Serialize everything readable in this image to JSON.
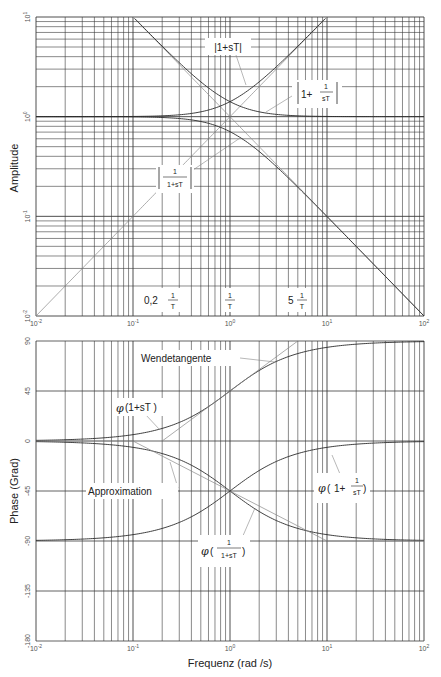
{
  "chart_data": [
    {
      "type": "line",
      "title": "",
      "xscale": "log",
      "yscale": "log",
      "xlabel": "",
      "ylabel": "Amplitude",
      "xlim": [
        0.01,
        100
      ],
      "ylim": [
        0.01,
        10
      ],
      "grid": true,
      "x_tick_labels": [
        "10^-2",
        "10^-1",
        "10^0",
        "10^1",
        "10^2"
      ],
      "y_tick_labels": [
        "10^-2",
        "10^-1",
        "10^0",
        "10^1"
      ],
      "x": [
        0.01,
        0.1,
        0.2,
        0.5,
        1,
        2,
        5,
        10,
        100
      ],
      "series": [
        {
          "name": "|1+sT|",
          "values": [
            1.0,
            1.005,
            1.02,
            1.118,
            1.414,
            2.236,
            5.099,
            10.05,
            100.0
          ]
        },
        {
          "name": "|1+1/(sT)|",
          "values": [
            100.0,
            10.05,
            5.099,
            2.236,
            1.414,
            1.118,
            1.02,
            1.005,
            1.0
          ]
        },
        {
          "name": "|1/(1+sT)|",
          "values": [
            1.0,
            0.995,
            0.981,
            0.894,
            0.707,
            0.447,
            0.196,
            0.0995,
            0.01
          ]
        },
        {
          "name": "Asymptote 1/ω",
          "values": [
            100,
            10,
            5,
            2,
            1,
            0.5,
            0.2,
            0.1,
            0.01
          ]
        },
        {
          "name": "Asymptote ω",
          "values": [
            0.01,
            0.1,
            0.2,
            0.5,
            1,
            2,
            5,
            10,
            100
          ]
        }
      ],
      "annotations": [
        {
          "text": "|1+sT|"
        },
        {
          "text": "|1+ 1/sT|"
        },
        {
          "text": "|1/(1+sT)|"
        },
        {
          "text": "0,2 1/T"
        },
        {
          "text": "1/T"
        },
        {
          "text": "5 1/T"
        }
      ]
    },
    {
      "type": "line",
      "title": "",
      "xscale": "log",
      "xlabel": "Frequenz (rad /s)",
      "ylabel": "Phase (Grad)",
      "xlim": [
        0.01,
        100
      ],
      "ylim": [
        -180,
        90
      ],
      "grid": true,
      "x_tick_labels": [
        "10^-2",
        "10^-1",
        "10^0",
        "10^1",
        "10^2"
      ],
      "y_ticks": [
        90,
        45,
        0,
        -45,
        -90,
        -135,
        -180
      ],
      "x": [
        0.01,
        0.1,
        0.2,
        0.5,
        1,
        2,
        5,
        10,
        100
      ],
      "series": [
        {
          "name": "φ(1+sT)",
          "values": [
            0.6,
            5.7,
            11.3,
            26.6,
            45.0,
            63.4,
            78.7,
            84.3,
            89.4
          ]
        },
        {
          "name": "φ(1+1/(sT))",
          "values": [
            -89.4,
            -84.3,
            -78.7,
            -63.4,
            -45.0,
            -26.6,
            -11.3,
            -5.7,
            -0.6
          ]
        },
        {
          "name": "φ(1/(1+sT))",
          "values": [
            -0.6,
            -5.7,
            -11.3,
            -26.6,
            -45.0,
            -63.4,
            -78.7,
            -84.3,
            -89.4
          ]
        },
        {
          "name": "Approximation",
          "values": [
            0,
            0,
            null,
            null,
            -45,
            null,
            null,
            -90,
            -90
          ]
        },
        {
          "name": "Wendetangente",
          "points": [
            [
              0.2,
              0
            ],
            [
              5,
              90
            ]
          ]
        }
      ],
      "annotations": [
        {
          "text": "Wendetangente"
        },
        {
          "text": "φ(1+sT)"
        },
        {
          "text": "Approximation"
        },
        {
          "text": "φ(1+ 1/sT)"
        },
        {
          "text": "φ(1/(1+sT))"
        }
      ]
    }
  ],
  "amplitude": {
    "ylabel": "Amplitude",
    "y_ticks": [
      {
        "base": "10",
        "exp": "1",
        "value": 10
      },
      {
        "base": "10",
        "exp": "0",
        "value": 1
      },
      {
        "base": "10",
        "exp": "-1",
        "value": 0.1
      },
      {
        "base": "10",
        "exp": "-2",
        "value": 0.01
      }
    ],
    "labels": {
      "abs_one_plus_sT": "|1+sT|",
      "one_plus": "1+",
      "one": "1",
      "sT": "sT",
      "one_plus_sT": "1+sT",
      "T": "T",
      "zero_two": "0,2",
      "five": "5"
    }
  },
  "phase": {
    "ylabel": "Phase (Grad)",
    "xlabel": "Frequenz (rad /s)",
    "y_ticks": [
      "90",
      "45",
      "0",
      "-45",
      "-90",
      "-135",
      "-180"
    ],
    "labels": {
      "wendetangente": "Wendetangente",
      "approximation": "Approximation",
      "phi": "φ",
      "phi_one_plus_sT": "(1+sT )",
      "one_plus": "1+",
      "one": "1",
      "sT": "sT",
      "one_plus_sT": "1+sT"
    }
  },
  "x_ticks": [
    {
      "base": "10",
      "exp": "-2"
    },
    {
      "base": "10",
      "exp": "-1"
    },
    {
      "base": "10",
      "exp": "0"
    },
    {
      "base": "10",
      "exp": "1"
    },
    {
      "base": "10",
      "exp": "2"
    }
  ],
  "colors": {
    "grid": "#3a3a3a",
    "curve": "#2a2a2a",
    "asymptote": "#888888",
    "text": "#222222"
  }
}
